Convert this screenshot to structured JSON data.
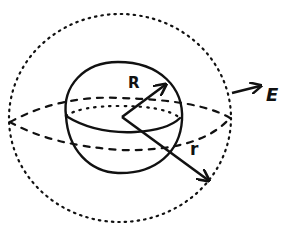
{
  "diagram": {
    "title": "",
    "colors": {
      "ink": "#111111",
      "background": "#ffffff"
    },
    "elements": {
      "inner_sphere": {
        "style": "solid",
        "radius_symbol": "R"
      },
      "outer_sphere": {
        "style": "dotted",
        "radius_symbol": "r"
      },
      "equator_inner": {
        "style": "dotted-back, solid-front"
      },
      "equator_outer": {
        "style": "dashed"
      }
    },
    "labels": {
      "inner_radius": "R",
      "outer_radius": "r",
      "field": "E"
    }
  }
}
